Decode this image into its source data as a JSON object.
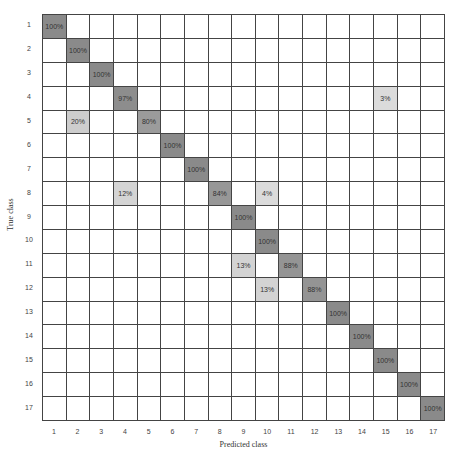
{
  "chart_data": {
    "type": "heatmap",
    "title": "",
    "xlabel": "Predicted class",
    "ylabel": "True class",
    "x_categories": [
      "1",
      "2",
      "3",
      "4",
      "5",
      "6",
      "7",
      "8",
      "9",
      "10",
      "11",
      "12",
      "13",
      "14",
      "15",
      "16",
      "17"
    ],
    "y_categories": [
      "1",
      "2",
      "3",
      "4",
      "5",
      "6",
      "7",
      "8",
      "9",
      "10",
      "11",
      "12",
      "13",
      "14",
      "15",
      "16",
      "17"
    ],
    "value_format": "percent",
    "colormap": "grayscale (higher = darker)",
    "cells": [
      {
        "row": 1,
        "col": 1,
        "value": 100
      },
      {
        "row": 2,
        "col": 2,
        "value": 100
      },
      {
        "row": 3,
        "col": 3,
        "value": 100
      },
      {
        "row": 4,
        "col": 4,
        "value": 97
      },
      {
        "row": 4,
        "col": 15,
        "value": 3
      },
      {
        "row": 5,
        "col": 2,
        "value": 20
      },
      {
        "row": 5,
        "col": 5,
        "value": 80
      },
      {
        "row": 6,
        "col": 6,
        "value": 100
      },
      {
        "row": 7,
        "col": 7,
        "value": 100
      },
      {
        "row": 8,
        "col": 4,
        "value": 12
      },
      {
        "row": 8,
        "col": 8,
        "value": 84
      },
      {
        "row": 8,
        "col": 10,
        "value": 4
      },
      {
        "row": 9,
        "col": 9,
        "value": 100
      },
      {
        "row": 10,
        "col": 10,
        "value": 100
      },
      {
        "row": 11,
        "col": 9,
        "value": 13
      },
      {
        "row": 11,
        "col": 11,
        "value": 88
      },
      {
        "row": 12,
        "col": 10,
        "value": 13
      },
      {
        "row": 12,
        "col": 12,
        "value": 88
      },
      {
        "row": 13,
        "col": 13,
        "value": 100
      },
      {
        "row": 14,
        "col": 14,
        "value": 100
      },
      {
        "row": 15,
        "col": 15,
        "value": 100
      },
      {
        "row": 16,
        "col": 16,
        "value": 100
      },
      {
        "row": 17,
        "col": 17,
        "value": 100
      }
    ],
    "grid": true,
    "legend": "none"
  },
  "colors": {
    "high": "#8c8c8c",
    "low": "#d9d9d9",
    "empty": "#ffffff",
    "gridline": "#444444"
  }
}
